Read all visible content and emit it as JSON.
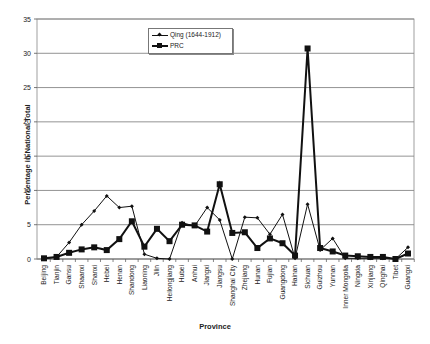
{
  "chart_data": {
    "type": "line",
    "title": "",
    "xlabel": "Province",
    "ylabel": "Percentage in National Total",
    "ylim": [
      0,
      35
    ],
    "yticks": [
      0,
      5,
      10,
      15,
      20,
      25,
      30,
      35
    ],
    "grid": true,
    "legend_position": "upper-center",
    "categories": [
      "Beijing",
      "Tianjin",
      "Gansu",
      "Shaanxi",
      "Shanxi",
      "Hebei",
      "Henan",
      "Shandong",
      "Liaoning",
      "Jilin",
      "Heilongjiang",
      "Hubei",
      "Anhui",
      "Jiangxi",
      "Jiangsu",
      "Shanghai City",
      "Zhejiang",
      "Hunan",
      "Fujian",
      "Guangdong",
      "Hainan",
      "Sichuan",
      "Guizhou",
      "Yunnan",
      "Inner Mongolia",
      "Ningxia",
      "Xinjiang",
      "Qinghai",
      "Tibet",
      "Guangxi"
    ],
    "series": [
      {
        "name": "Qing (1644-1912)",
        "marker": "diamond",
        "line_width": 1,
        "values": [
          0,
          0.3,
          2.4,
          5.0,
          7.0,
          9.2,
          7.5,
          7.7,
          0.7,
          0.1,
          0,
          5.3,
          4.8,
          7.5,
          5.7,
          0,
          6.1,
          6.0,
          3.6,
          6.5,
          0.1,
          8.0,
          1.3,
          3.0,
          0.1,
          0.1,
          0.1,
          0.1,
          0,
          1.7
        ]
      },
      {
        "name": "PRC",
        "marker": "square",
        "line_width": 2,
        "values": [
          0.1,
          0.3,
          0.9,
          1.4,
          1.7,
          1.3,
          2.9,
          5.5,
          1.8,
          4.4,
          2.6,
          5.0,
          4.9,
          4.0,
          10.9,
          3.8,
          3.9,
          1.6,
          3.0,
          2.3,
          0.5,
          30.7,
          1.6,
          1.1,
          0.5,
          0.4,
          0.3,
          0.3,
          0,
          0.8
        ]
      }
    ]
  }
}
